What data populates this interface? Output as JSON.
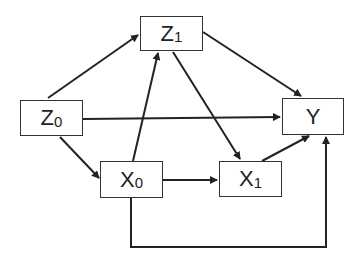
{
  "diagram": {
    "type": "causal-dag",
    "nodes": [
      {
        "id": "Z0",
        "label": "Z",
        "sub": "0",
        "x": 20,
        "y": 100,
        "w": 63,
        "h": 36
      },
      {
        "id": "Z1",
        "label": "Z",
        "sub": "1",
        "x": 140,
        "y": 16,
        "w": 63,
        "h": 35
      },
      {
        "id": "Y",
        "label": "Y",
        "sub": "",
        "x": 282,
        "y": 98,
        "w": 62,
        "h": 37
      },
      {
        "id": "X0",
        "label": "X",
        "sub": "0",
        "x": 100,
        "y": 161,
        "w": 63,
        "h": 37
      },
      {
        "id": "X1",
        "label": "X",
        "sub": "1",
        "x": 219,
        "y": 161,
        "w": 63,
        "h": 36
      }
    ],
    "edges": [
      {
        "from": "Z0",
        "to": "Z1"
      },
      {
        "from": "Z0",
        "to": "Y"
      },
      {
        "from": "Z0",
        "to": "X0"
      },
      {
        "from": "Z1",
        "to": "Y"
      },
      {
        "from": "Z1",
        "to": "X1"
      },
      {
        "from": "X0",
        "to": "Z1"
      },
      {
        "from": "X0",
        "to": "X1"
      },
      {
        "from": "X0",
        "to": "Y",
        "routing": "elbow-below"
      },
      {
        "from": "X1",
        "to": "Y"
      }
    ],
    "colors": {
      "stroke": "#222222",
      "box_border": "#333333",
      "background": "#ffffff"
    }
  }
}
